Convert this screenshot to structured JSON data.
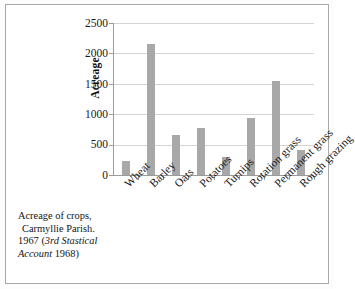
{
  "chart_data": {
    "type": "bar",
    "title": "",
    "xlabel": "",
    "ylabel": "Acreage",
    "categories": [
      "Wheat",
      "Barley",
      "Oats",
      "Potatoes",
      "Turnips",
      "Rotation grass",
      "Permanent grass",
      "Rough grazing"
    ],
    "values": [
      230,
      2150,
      660,
      780,
      290,
      935,
      1545,
      410
    ],
    "ylim": [
      0,
      2500
    ],
    "y_ticks": [
      0,
      500,
      1000,
      1500,
      2000,
      2500
    ],
    "y_tick_labels": [
      "0",
      "500",
      "1000",
      "1500",
      "2000",
      "2500"
    ],
    "grid": "horizontal",
    "legend": "none",
    "bar_color": "#a8a8a8",
    "gridline_color": "#d4d4d4",
    "axis_color": "#9b9b9b"
  },
  "caption": {
    "line1": "Acreage of crops,",
    "line2": "Carmyllie Parish.",
    "line3_prefix": "1967 (",
    "line3_italic": "3rd Stastical",
    "line4_italic": "Account",
    "line4_suffix": " 1968)"
  },
  "axes": {
    "y_title": "Acreage"
  }
}
